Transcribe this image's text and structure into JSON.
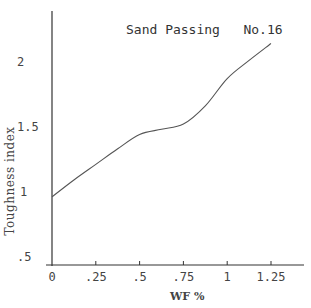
{
  "chart_data": {
    "type": "line",
    "title": "Sand Passing   No.16",
    "xlabel": "WF %",
    "ylabel": "Toughness index",
    "x_ticks": [
      "0",
      ".25",
      ".5",
      ".75",
      "1",
      "1.25"
    ],
    "x_tick_values": [
      0,
      0.25,
      0.5,
      0.75,
      1.0,
      1.25
    ],
    "y_ticks": [
      ".5",
      "1",
      "1.5",
      "2"
    ],
    "y_tick_values": [
      0.5,
      1.0,
      1.5,
      2.0
    ],
    "xlim": [
      0,
      1.45
    ],
    "ylim": [
      0.45,
      2.4
    ],
    "grid": false,
    "legend": null,
    "series": [
      {
        "name": "Sand Passing No.16",
        "x": [
          0,
          0.125,
          0.25,
          0.375,
          0.5,
          0.625,
          0.75,
          0.875,
          1.0,
          1.125,
          1.25
        ],
        "values": [
          0.97,
          1.1,
          1.22,
          1.34,
          1.45,
          1.49,
          1.53,
          1.67,
          1.88,
          2.02,
          2.15
        ]
      }
    ],
    "line_color": "#555555",
    "axis_color": "#333333"
  }
}
